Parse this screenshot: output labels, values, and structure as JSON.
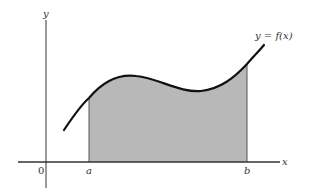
{
  "diagram": {
    "type": "area-under-curve",
    "function_label": "y = f(x)",
    "axes": {
      "x_label": "x",
      "y_label": "y",
      "origin_label": "0"
    },
    "bounds": {
      "lower_label": "a",
      "upper_label": "b"
    },
    "colors": {
      "fill": "#b8b8b8",
      "curve": "#111111",
      "axes": "#444444",
      "background": "#ffffff"
    }
  }
}
